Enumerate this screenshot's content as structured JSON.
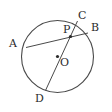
{
  "figure": {
    "background_color": "#ffffff",
    "stroke_color": "#4a4a4a",
    "label_color": "#2b2b2b",
    "canvas": {
      "width": 112,
      "height": 112
    }
  },
  "circle": {
    "name": "circle-O",
    "center_x": 57.5,
    "center_y": 56.5,
    "radius": 36,
    "stroke_width": 1.1
  },
  "points": {
    "A": {
      "label": "A",
      "x": 26,
      "y": 47.5,
      "label_x": 9,
      "label_y": 38,
      "marker": false
    },
    "B": {
      "label": "B",
      "x": 88,
      "y": 33,
      "label_x": 91,
      "label_y": 22,
      "marker": false
    },
    "C": {
      "label": "C",
      "x": 77.5,
      "y": 21,
      "label_x": 78,
      "label_y": 10,
      "marker": false
    },
    "D": {
      "label": "D",
      "x": 45.5,
      "y": 90.5,
      "label_x": 35,
      "label_y": 93,
      "marker": false
    },
    "O": {
      "label": "O",
      "x": 57.5,
      "y": 56.5,
      "label_x": 60,
      "label_y": 57,
      "marker": true
    },
    "P": {
      "label": "P",
      "x": 70.5,
      "y": 36.5,
      "label_x": 63,
      "label_y": 24,
      "marker": true
    }
  },
  "segments": [
    {
      "name": "chord-AB",
      "from": "A",
      "to": "B"
    },
    {
      "name": "diameter-CD",
      "from": "C",
      "to": "D"
    }
  ],
  "markers": {
    "dot_radius": 1.6,
    "dot_color": "#2b2b2b"
  }
}
